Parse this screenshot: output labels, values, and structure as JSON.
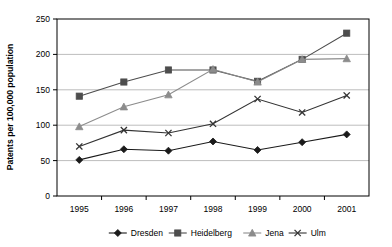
{
  "chart_data": {
    "type": "line",
    "title": "",
    "subtitle": "",
    "xlabel": "",
    "ylabel": "Patents per 100,000 population",
    "categories": [
      "1995",
      "1996",
      "1997",
      "1998",
      "1999",
      "2000",
      "2001"
    ],
    "x": [
      1995,
      1996,
      1997,
      1998,
      1999,
      2000,
      2001
    ],
    "ylim": [
      0,
      250
    ],
    "yticks": [
      0,
      50,
      100,
      150,
      200,
      250
    ],
    "ytick_labels": [
      "0",
      "50",
      "100",
      "150",
      "200",
      "250"
    ],
    "grid": "horizontal",
    "legend_position": "bottom",
    "series": [
      {
        "name": "Dresden",
        "marker": "diamond",
        "color": "#1a1a1a",
        "values": [
          51,
          66,
          64,
          77,
          65,
          76,
          87
        ]
      },
      {
        "name": "Heidelberg",
        "marker": "square",
        "color": "#4d4d4d",
        "values": [
          141,
          161,
          178,
          178,
          162,
          193,
          230
        ]
      },
      {
        "name": "Jena",
        "marker": "triangle",
        "color": "#8c8c8c",
        "values": [
          98,
          126,
          143,
          179,
          161,
          193,
          194
        ]
      },
      {
        "name": "Ulm",
        "marker": "x",
        "color": "#333333",
        "values": [
          70,
          93,
          89,
          102,
          137,
          118,
          142
        ]
      }
    ]
  },
  "axis": {
    "y_title": "Patents per 100,000 population"
  },
  "legend": {
    "items": [
      {
        "label": "Dresden"
      },
      {
        "label": "Heidelberg"
      },
      {
        "label": "Jena"
      },
      {
        "label": "Ulm"
      }
    ]
  },
  "colors": {
    "plot_border": "#000000",
    "gridline": "#bdbdbd",
    "background": "#ffffff"
  }
}
